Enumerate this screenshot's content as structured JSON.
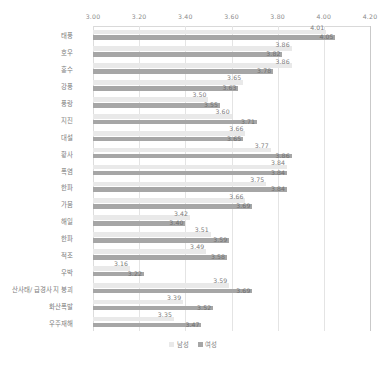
{
  "chart_data": {
    "type": "bar",
    "orientation": "horizontal",
    "title": "",
    "xlabel": "",
    "ylabel": "",
    "xlim": [
      3.0,
      4.2
    ],
    "xticks": [
      "3.00",
      "3.20",
      "3.40",
      "3.60",
      "3.80",
      "4.00",
      "4.20"
    ],
    "xtick_values": [
      3.0,
      3.2,
      3.4,
      3.6,
      3.8,
      4.0,
      4.2
    ],
    "grid": true,
    "legend_position": "bottom",
    "categories": [
      "태풍",
      "호우",
      "홍수",
      "강풍",
      "풍랑",
      "지진",
      "대설",
      "황사",
      "폭염",
      "한파",
      "가뭄",
      "해일",
      "한파",
      "적조",
      "우박",
      "산사태/ 급경사지 붕괴",
      "화산폭발",
      "우주재해"
    ],
    "series": [
      {
        "name": "남성",
        "color": "#e9e9e9",
        "values": [
          4.01,
          3.86,
          3.86,
          3.65,
          3.5,
          3.6,
          3.66,
          3.77,
          3.84,
          3.75,
          3.66,
          3.42,
          3.51,
          3.49,
          3.16,
          3.59,
          3.39,
          3.35
        ]
      },
      {
        "name": "여성",
        "color": "#a6a6a6",
        "values": [
          4.05,
          3.82,
          3.78,
          3.63,
          3.55,
          3.71,
          3.65,
          3.86,
          3.84,
          3.84,
          3.69,
          3.4,
          3.59,
          3.58,
          3.22,
          3.69,
          3.52,
          3.47
        ]
      }
    ],
    "value_labels": {
      "남성": [
        "4.01",
        "3.86",
        "3.86",
        "3.65",
        "3.50",
        "3.60",
        "3.66",
        "3.77",
        "3.84",
        "3.75",
        "3.66",
        "3.42",
        "3.51",
        "3.49",
        "3.16",
        "3.59",
        "3.39",
        "3.35"
      ],
      "여성": [
        "4.05",
        "3.82",
        "3.78",
        "3.63",
        "3.55",
        "3.71",
        "3.65",
        "3.86",
        "3.84",
        "3.84",
        "3.69",
        "3.40",
        "3.59",
        "3.58",
        "3.22",
        "3.69",
        "3.52",
        "3.47"
      ]
    }
  },
  "legend": {
    "items": [
      {
        "label": "남성",
        "swatch": "male"
      },
      {
        "label": "여성",
        "swatch": "female"
      }
    ]
  }
}
